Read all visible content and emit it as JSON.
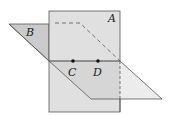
{
  "diagram": {
    "type": "intersecting-planes",
    "planes": [
      {
        "label": "A",
        "orientation": "vertical"
      },
      {
        "label": "B",
        "orientation": "horizontal-slanted"
      }
    ],
    "intersection_points": [
      {
        "label": "C"
      },
      {
        "label": "D"
      }
    ],
    "colors": {
      "plane_a": "#e0e0e0",
      "plane_b_upper": "#cbcbcb",
      "plane_b_lower": "#ececec",
      "overlap": "#d6d6d6",
      "edge": "#555555"
    }
  }
}
